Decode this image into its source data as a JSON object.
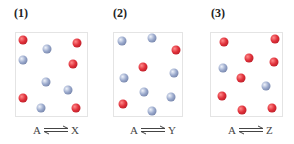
{
  "panels": [
    {
      "label": "(1)",
      "reactant": "A",
      "product": "X",
      "counts": {
        "red": 5,
        "blue": 5
      },
      "spheres": [
        {
          "color": "red",
          "x": 23,
          "y": 40
        },
        {
          "color": "blue",
          "x": 47,
          "y": 49
        },
        {
          "color": "red",
          "x": 77,
          "y": 43
        },
        {
          "color": "blue",
          "x": 23,
          "y": 60
        },
        {
          "color": "red",
          "x": 73,
          "y": 64
        },
        {
          "color": "blue",
          "x": 46,
          "y": 82
        },
        {
          "color": "blue",
          "x": 68,
          "y": 90
        },
        {
          "color": "red",
          "x": 23,
          "y": 98
        },
        {
          "color": "blue",
          "x": 41,
          "y": 108
        },
        {
          "color": "red",
          "x": 76,
          "y": 108
        }
      ]
    },
    {
      "label": "(2)",
      "reactant": "A",
      "product": "Y",
      "counts": {
        "red": 3,
        "blue": 7
      },
      "spheres": [
        {
          "color": "blue",
          "x": 122,
          "y": 41
        },
        {
          "color": "blue",
          "x": 152,
          "y": 38
        },
        {
          "color": "red",
          "x": 176,
          "y": 50
        },
        {
          "color": "red",
          "x": 143,
          "y": 67
        },
        {
          "color": "blue",
          "x": 124,
          "y": 78
        },
        {
          "color": "blue",
          "x": 174,
          "y": 73
        },
        {
          "color": "blue",
          "x": 144,
          "y": 92
        },
        {
          "color": "blue",
          "x": 171,
          "y": 97
        },
        {
          "color": "red",
          "x": 123,
          "y": 104
        },
        {
          "color": "blue",
          "x": 152,
          "y": 111
        }
      ]
    },
    {
      "label": "(3)",
      "reactant": "A",
      "product": "Z",
      "counts": {
        "red": 8,
        "blue": 2
      },
      "spheres": [
        {
          "color": "red",
          "x": 224,
          "y": 42
        },
        {
          "color": "red",
          "x": 275,
          "y": 39
        },
        {
          "color": "red",
          "x": 249,
          "y": 58
        },
        {
          "color": "red",
          "x": 274,
          "y": 62
        },
        {
          "color": "blue",
          "x": 223,
          "y": 68
        },
        {
          "color": "red",
          "x": 241,
          "y": 78
        },
        {
          "color": "blue",
          "x": 266,
          "y": 86
        },
        {
          "color": "red",
          "x": 222,
          "y": 96
        },
        {
          "color": "red",
          "x": 242,
          "y": 110
        },
        {
          "color": "red",
          "x": 272,
          "y": 108
        }
      ]
    }
  ],
  "colors": {
    "red_sphere": "#e0303a",
    "blue_sphere": "#9aa9cc",
    "box_border": "#e4e4e4"
  },
  "arrow_symbol": "equilibrium-arrows"
}
